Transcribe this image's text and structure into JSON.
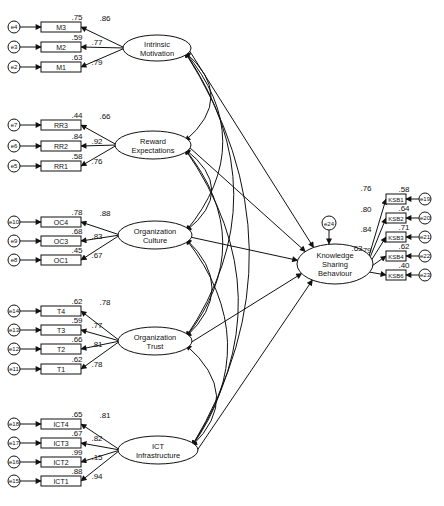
{
  "diagram": {
    "type": "structural-equation-model",
    "latents": [
      {
        "id": "IM",
        "line1": "Intrinsic",
        "line2": "Motivation",
        "cx": 157,
        "cy": 48,
        "rx": 34,
        "ry": 13
      },
      {
        "id": "RE",
        "line1": "Reward",
        "line2": "Expectations",
        "cx": 153,
        "cy": 145,
        "rx": 38,
        "ry": 14
      },
      {
        "id": "OC",
        "line1": "Organization",
        "line2": "Culture",
        "cx": 155,
        "cy": 235,
        "rx": 37,
        "ry": 14
      },
      {
        "id": "OT",
        "line1": "Organization",
        "line2": "Trust",
        "cx": 155,
        "cy": 341,
        "rx": 37,
        "ry": 14
      },
      {
        "id": "ICT",
        "line1": "ICT",
        "line2": "Infrastructure",
        "cx": 158,
        "cy": 450,
        "rx": 40,
        "ry": 14
      }
    ],
    "outcome": {
      "id": "KSB",
      "line1": "Knowledge",
      "line2": "Sharing",
      "line3": "Behaviour",
      "cx": 335,
      "cy": 264,
      "rx": 38,
      "ry": 20,
      "r2": ".63",
      "error": "e24"
    },
    "indicators": {
      "IM": [
        {
          "name": "M3",
          "error": "e4",
          "loading": ".86",
          "r2": ".75",
          "y": 27
        },
        {
          "name": "M2",
          "error": "e3",
          "loading": ".77",
          "r2": ".59",
          "y": 47
        },
        {
          "name": "M1",
          "error": "e2",
          "loading": ".79",
          "r2": ".63",
          "y": 67
        }
      ],
      "RE": [
        {
          "name": "RR3",
          "error": "e7",
          "loading": ".66",
          "r2": ".44",
          "y": 125
        },
        {
          "name": "RR2",
          "error": "e6",
          "loading": ".92",
          "r2": ".84",
          "y": 146
        },
        {
          "name": "RR1",
          "error": "e5",
          "loading": ".76",
          "r2": ".58",
          "y": 166
        }
      ],
      "OC": [
        {
          "name": "OC4",
          "error": "e10",
          "loading": ".88",
          "r2": ".78",
          "y": 222
        },
        {
          "name": "OC3",
          "error": "e9",
          "loading": ".83",
          "r2": ".68",
          "y": 241
        },
        {
          "name": "OC1",
          "error": "e8",
          "loading": ".67",
          "r2": ".45",
          "y": 260
        }
      ],
      "OT": [
        {
          "name": "T4",
          "error": "e14",
          "loading": ".78",
          "r2": ".62",
          "y": 311
        },
        {
          "name": "T3",
          "error": "e13",
          "loading": ".77",
          "r2": ".59",
          "y": 330
        },
        {
          "name": "T2",
          "error": "e12",
          "loading": ".81",
          "r2": ".66",
          "y": 349
        },
        {
          "name": "T1",
          "error": "e11",
          "loading": ".78",
          "r2": ".62",
          "y": 369
        }
      ],
      "ICT": [
        {
          "name": "ICT4",
          "error": "e18",
          "loading": ".81",
          "r2": ".65",
          "y": 424
        },
        {
          "name": "ICT3",
          "error": "e17",
          "loading": ".82",
          "r2": ".67",
          "y": 443
        },
        {
          "name": "ICT2",
          "error": "e16",
          "loading": ".15",
          "r2": ".99",
          "y": 462
        },
        {
          "name": "ICT1",
          "error": "e15",
          "loading": ".94",
          "r2": ".88",
          "y": 481
        }
      ],
      "KSB": [
        {
          "name": "KSB1",
          "error": "e19",
          "loading": ".76",
          "r2": ".58",
          "y": 199
        },
        {
          "name": "KSB2",
          "error": "e20",
          "loading": ".80",
          "r2": ".64",
          "y": 218
        },
        {
          "name": "KSB3",
          "error": "e21",
          "loading": ".84",
          "r2": ".71",
          "y": 237
        },
        {
          "name": "KSB4",
          "error": "e22",
          "loading": ".79",
          "r2": ".62",
          "y": 256
        },
        {
          "name": "KSB6",
          "error": "e23",
          "loading": "",
          "r2": ".40",
          "y": 275
        }
      ]
    }
  }
}
